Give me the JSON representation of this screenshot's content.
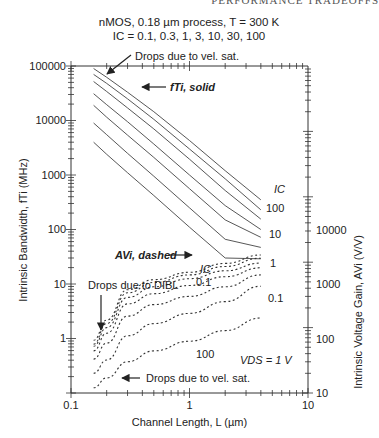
{
  "page_header": "PERFORMANCE TRADEOFFS",
  "chart_data": {
    "type": "line",
    "title": "nMOS, 0.18 µm process, T = 300 K",
    "subtitle": "IC = 0.1, 0.3, 1, 3, 10, 30, 100",
    "xlabel": "Channel Length, L (µm)",
    "ylabel_left": "Intrinsic Bandwidth, fTi (MHz)",
    "ylabel_right": "Intrinsic Voltage Gain, AVi (V/V)",
    "x_scale": "log",
    "xlim": [
      0.1,
      10
    ],
    "ylim_left": [
      0.1,
      100000
    ],
    "ylim_right": [
      10,
      1000000
    ],
    "x_ticks": [
      "0.1",
      "1",
      "10"
    ],
    "y_ticks_left": [
      "100000",
      "10000",
      "1000",
      "100",
      "10",
      "1"
    ],
    "y_ticks_right": [
      "10000",
      "1000",
      "100",
      "10"
    ],
    "grid": false,
    "annotations": {
      "ft_label": "fTi, solid",
      "av_label": "AVi, dashed",
      "ic_header_ft": "IC",
      "ic_header_av": "IC",
      "ft_ic_labels": [
        "100",
        "10",
        "1",
        "0.1"
      ],
      "av_ic_labels": [
        "0.1",
        "100"
      ],
      "vel_sat_top": "Drops due to vel. sat.",
      "vel_sat_bottom": "Drops due to vel. sat.",
      "dibl": "Drops due to DIBL",
      "vds": "VDS = 1 V"
    },
    "x": [
      0.155,
      0.2,
      0.3,
      0.5,
      1,
      2,
      4
    ],
    "series_ft": [
      {
        "name": "fTi IC=100",
        "ic": 100,
        "values": [
          90000,
          62000,
          33000,
          14500,
          4300,
          1200,
          350
        ]
      },
      {
        "name": "fTi IC=30",
        "ic": 30,
        "values": [
          70000,
          48000,
          25000,
          10500,
          3000,
          850,
          230
        ]
      },
      {
        "name": "fTi IC=10",
        "ic": 10,
        "values": [
          52000,
          34000,
          17000,
          7000,
          1950,
          520,
          155
        ]
      },
      {
        "name": "fTi IC=3",
        "ic": 3,
        "values": [
          31000,
          19500,
          9500,
          3700,
          1000,
          275,
          100
        ]
      },
      {
        "name": "fTi IC=1",
        "ic": 1,
        "values": [
          19000,
          11500,
          5400,
          2100,
          560,
          150,
          72
        ]
      },
      {
        "name": "fTi IC=0.3",
        "ic": 0.3,
        "values": [
          9000,
          5500,
          2500,
          950,
          250,
          66,
          47
        ]
      },
      {
        "name": "fTi IC=0.1",
        "ic": 0.1,
        "values": [
          4000,
          2400,
          1100,
          420,
          110,
          30,
          29
        ]
      }
    ],
    "series_av": [
      {
        "name": "AVi IC=0.1",
        "ic": 0.1,
        "values": [
          64,
          130,
          380,
          540,
          700,
          960,
          1290
        ]
      },
      {
        "name": "AVi IC=0.3",
        "ic": 0.3,
        "values": [
          56,
          115,
          340,
          490,
          640,
          860,
          1150
        ]
      },
      {
        "name": "AVi IC=1",
        "ic": 1,
        "values": [
          52,
          100,
          290,
          420,
          560,
          740,
          970
        ]
      },
      {
        "name": "AVi IC=3",
        "ic": 3,
        "values": [
          44,
          82,
          230,
          330,
          440,
          600,
          820
        ]
      },
      {
        "name": "AVi IC=10",
        "ic": 10,
        "values": [
          33,
          58,
          150,
          225,
          300,
          420,
          640
        ]
      },
      {
        "name": "AVi IC=30",
        "ic": 30,
        "values": [
          20,
          32,
          75,
          115,
          165,
          250,
          430
        ]
      },
      {
        "name": "AVi IC=100",
        "ic": 100,
        "values": [
          12,
          17,
          30,
          44,
          62,
          90,
          140
        ]
      }
    ]
  }
}
